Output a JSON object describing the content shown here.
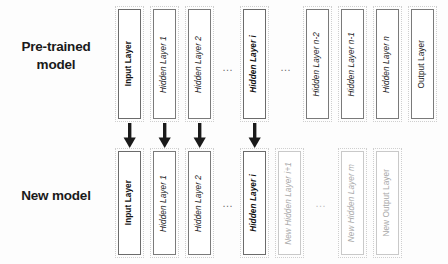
{
  "figure": {
    "type": "layered-network-transfer",
    "rows": 2
  },
  "rows": {
    "pretrained": {
      "label": "Pre-trained\nmodel",
      "label_line1": "Pre-trained",
      "label_line2": "model"
    },
    "new": {
      "label": "New model",
      "label_line1": "New model",
      "label_line2": ""
    }
  },
  "pretrained_layers": [
    {
      "label": "Input Layer",
      "style": "solid-strong",
      "italic_tail": ""
    },
    {
      "label": "Hidden Layer 1",
      "style": "solid",
      "italic_tail": "1"
    },
    {
      "label": "Hidden Layer 2",
      "style": "solid",
      "italic_tail": "2"
    },
    {
      "label": "Hidden Layer i",
      "style": "solid-strong",
      "italic_tail": "i"
    },
    {
      "label": "Hidden Layer n-2",
      "style": "solid",
      "italic_tail": "n-2"
    },
    {
      "label": "Hidden Layer n-1",
      "style": "solid",
      "italic_tail": "n-1"
    },
    {
      "label": "Hidden Layer n",
      "style": "solid",
      "italic_tail": "n"
    },
    {
      "label": "Output Layer",
      "style": "solid",
      "italic_tail": ""
    }
  ],
  "new_layers": [
    {
      "label": "Input Layer",
      "style": "solid-strong",
      "italic_tail": ""
    },
    {
      "label": "Hidden Layer 1",
      "style": "solid",
      "italic_tail": "1"
    },
    {
      "label": "Hidden Layer 2",
      "style": "solid",
      "italic_tail": "2"
    },
    {
      "label": "Hidden Layer i",
      "style": "solid-strong",
      "italic_tail": "i"
    },
    {
      "label": "New Hidden Layer i+1",
      "style": "faint",
      "italic_tail": "i+1"
    },
    {
      "label": "New Hidden Layer m",
      "style": "faint",
      "italic_tail": "m"
    },
    {
      "label": "New Output Layer",
      "style": "faint",
      "italic_tail": ""
    }
  ],
  "layer_text": {
    "input_layer": "Input Layer",
    "output_layer": "Output Layer",
    "hidden_layer_1": "Hidden Layer 1",
    "hidden_layer_2": "Hidden Layer 2",
    "hidden_layer_i": "Hidden Layer i",
    "hidden_layer_n_minus_2": "Hidden Layer n-2",
    "hidden_layer_n_minus_1": "Hidden Layer n-1",
    "hidden_layer_n": "Hidden Layer n",
    "new_hidden_layer_i_plus_1": "New Hidden Layer i+1",
    "new_hidden_layer_m": "New Hidden Layer m",
    "new_output_layer": "New Output Layer"
  },
  "ellipses": {
    "top_left": "…",
    "top_right": "…",
    "bottom_left": "…",
    "bottom_right": "…"
  },
  "arrows": {
    "count": 4,
    "direction": "down",
    "meaning": "weights transferred from pre-trained layer to new model layer",
    "sources": [
      "Input Layer",
      "Hidden Layer 1",
      "Hidden Layer 2",
      "Hidden Layer i"
    ]
  },
  "colors": {
    "background": "#fdfdfd",
    "box_border_solid": "#7a7a7a",
    "box_border_faint": "#c9c9c9",
    "text_dark": "#1a1a1a",
    "text_faint": "#a9a9a9",
    "arrow": "#1a1a1a",
    "dashed_group": "#cfcfcf"
  }
}
